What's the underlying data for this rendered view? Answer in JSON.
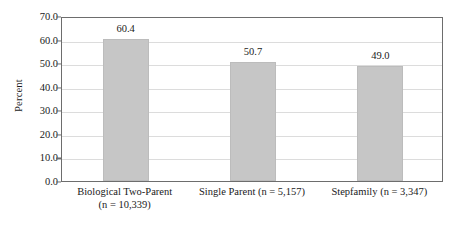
{
  "chart_data": {
    "type": "bar",
    "title": "",
    "subtitle": "",
    "xlabel": "",
    "ylabel": "Percent",
    "ylim": [
      0,
      70
    ],
    "ytick_step": 10,
    "grid": true,
    "legend": null,
    "categories": [
      "Biological Two-Parent (n = 10,339)",
      "Single Parent (n = 5,157)",
      "Stepfamily (n = 3,347)"
    ],
    "category_lines": [
      [
        "Biological Two-Parent",
        "(n = 10,339)"
      ],
      [
        "Single Parent (n = 5,157)",
        ""
      ],
      [
        "Stepfamily (n = 3,347)",
        ""
      ]
    ],
    "values": [
      60.4,
      50.7,
      49.0
    ],
    "value_labels": [
      "60.4",
      "50.7",
      "49.0"
    ],
    "ytick_labels": [
      "0.0",
      "10.0",
      "20.0",
      "30.0",
      "40.0",
      "50.0",
      "60.0",
      "70.0"
    ],
    "ytick_values": [
      0,
      10,
      20,
      30,
      40,
      50,
      60,
      70
    ],
    "bar_color": "#c6c6c6",
    "gridline_color": "#dcdcdc",
    "axis_color": "#6d6d6d",
    "text_color": "#1a1a1a",
    "background_color": "#ffffff"
  }
}
